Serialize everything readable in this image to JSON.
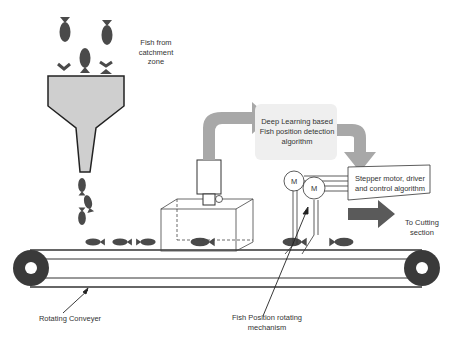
{
  "labels": {
    "fish_source": "Fish from catchment zone",
    "fish_source_lines": [
      "Fish from",
      "catchment",
      "zone"
    ],
    "detection": "Deep Learning based Fish position detection algorithm",
    "detection_lines": [
      "Deep Learning based",
      "Fish position detection",
      "algorithm"
    ],
    "stepper": "Stepper motor, driver and control algorithm",
    "stepper_lines": [
      "Stepper motor, driver",
      "and control algorithm"
    ],
    "output": "To Cutting section",
    "output_lines": [
      "To Cutting",
      "section"
    ],
    "conveyor": "Rotating Conveyer",
    "rotator": "Fish Position rotating mechanism",
    "rotator_lines": [
      "Fish Position rotating",
      "mechanism"
    ],
    "motor_symbol": "M"
  },
  "colors": {
    "fish": "#4a4a4a",
    "hopper_fill": "#cfcfcf",
    "arrow_gray": "#a8a8a8",
    "dark_arrow": "#5a5a5a",
    "box_fill": "#efefef",
    "line": "#222222"
  }
}
